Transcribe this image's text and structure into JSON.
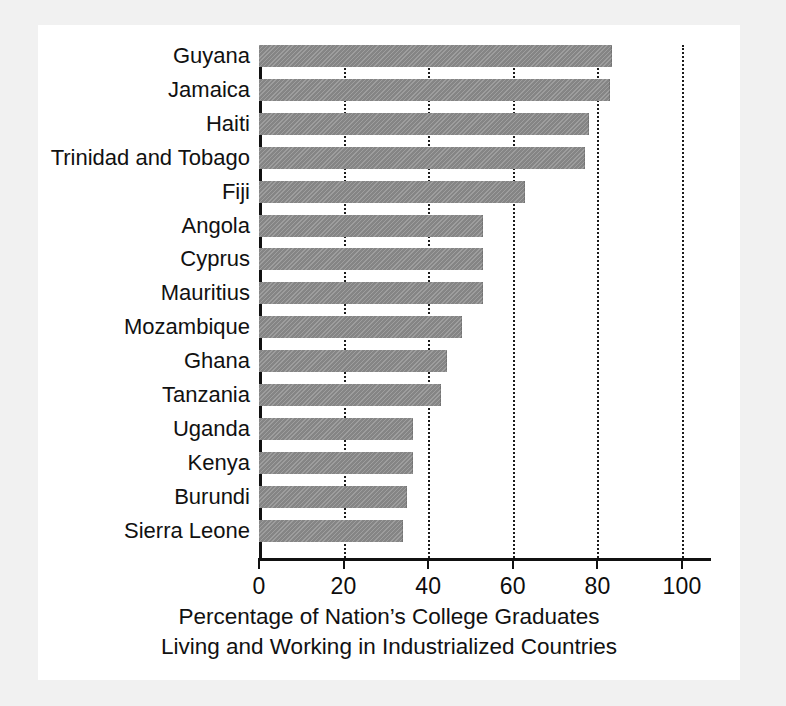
{
  "chart_data": {
    "type": "bar",
    "orientation": "horizontal",
    "title": "",
    "xlabel_line1": "Percentage of Nation’s College Graduates",
    "xlabel_line2": "Living and Working in Industrialized Countries",
    "ylabel": "",
    "xlim": [
      0,
      100
    ],
    "xticks": [
      0,
      20,
      40,
      60,
      80,
      100
    ],
    "xtick_labels": [
      "0",
      "20",
      "40",
      "60",
      "80",
      "100"
    ],
    "grid": "vertical dotted gridlines at each x tick",
    "legend": "none",
    "bar_color": "#8c8c8c",
    "categories": [
      "Guyana",
      "Jamaica",
      "Haiti",
      "Trinidad and Tobago",
      "Fiji",
      "Angola",
      "Cyprus",
      "Mauritius",
      "Mozambique",
      "Ghana",
      "Tanzania",
      "Uganda",
      "Kenya",
      "Burundi",
      "Sierra Leone"
    ],
    "values": [
      83.5,
      83,
      78,
      77,
      63,
      53,
      53,
      53,
      48,
      44.5,
      43,
      36.5,
      36.5,
      35,
      34
    ]
  }
}
